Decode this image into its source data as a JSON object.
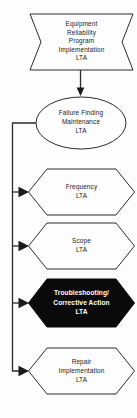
{
  "diagram": {
    "background_color": "#fdfdfd",
    "line_color": "#2b2b2b",
    "text_color": "#1a1a1a",
    "highlight_fill": "#0a0a0a",
    "highlight_text_color": "#ffffff",
    "nodes": [
      {
        "id": "equipment-reliability-program-implementation-lta",
        "shape": "chevron-bowtie",
        "highlighted": false,
        "lines": [
          "Equipment",
          "Reliability",
          "Program",
          "Implementation",
          "LTA"
        ]
      },
      {
        "id": "failure-finding-maintenance-lta",
        "shape": "ellipse",
        "highlighted": false,
        "lines": [
          "Failure Finding",
          "Maintenance",
          "LTA"
        ]
      },
      {
        "id": "frequency-lta",
        "shape": "hexagon",
        "highlighted": false,
        "lines": [
          "Frequency",
          "LTA"
        ]
      },
      {
        "id": "scope-lta",
        "shape": "hexagon",
        "highlighted": false,
        "lines": [
          "Scope",
          "LTA"
        ]
      },
      {
        "id": "troubleshooting-corrective-action-lta",
        "shape": "hexagon",
        "highlighted": true,
        "lines": [
          "Troubleshooting/",
          "Corrective Action",
          "LTA"
        ]
      },
      {
        "id": "repair-implementation-lta",
        "shape": "hexagon",
        "highlighted": false,
        "lines": [
          "Repair",
          "Implementation",
          "LTA"
        ]
      }
    ],
    "connectors": [
      {
        "id": "connector-program-to-failure-finding",
        "from": "equipment-reliability-program-implementation-lta",
        "to": "failure-finding-maintenance-lta",
        "direction": "down",
        "arrowhead": "filled-triangle"
      },
      {
        "id": "connector-bus-to-frequency",
        "from": "failure-finding-maintenance-lta",
        "to": "frequency-lta",
        "direction": "right",
        "arrowhead": "filled-triangle"
      },
      {
        "id": "connector-bus-to-scope",
        "from": "failure-finding-maintenance-lta",
        "to": "scope-lta",
        "direction": "right",
        "arrowhead": "filled-triangle"
      },
      {
        "id": "connector-bus-to-troubleshooting",
        "from": "failure-finding-maintenance-lta",
        "to": "troubleshooting-corrective-action-lta",
        "direction": "right",
        "arrowhead": "filled-triangle"
      },
      {
        "id": "connector-bus-to-repair",
        "from": "failure-finding-maintenance-lta",
        "to": "repair-implementation-lta",
        "direction": "right",
        "arrowhead": "filled-triangle"
      }
    ]
  }
}
